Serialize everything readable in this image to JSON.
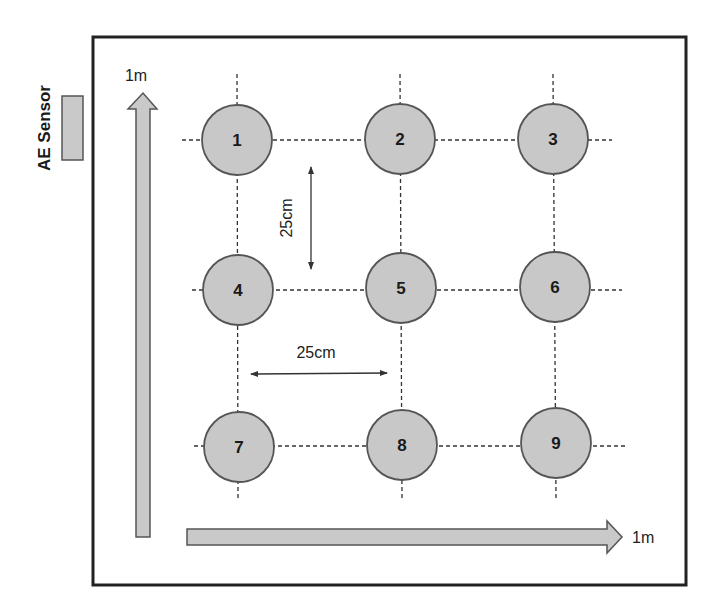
{
  "diagram": {
    "sensor": {
      "label": "AE Sensor"
    },
    "axes": {
      "vertical": {
        "label": "1m"
      },
      "horizontal": {
        "label": "1m"
      }
    },
    "spacing": {
      "vertical_label": "25cm",
      "horizontal_label": "25cm"
    },
    "nodes": [
      {
        "id": "1",
        "label": "1"
      },
      {
        "id": "2",
        "label": "2"
      },
      {
        "id": "3",
        "label": "3"
      },
      {
        "id": "4",
        "label": "4"
      },
      {
        "id": "5",
        "label": "5"
      },
      {
        "id": "6",
        "label": "6"
      },
      {
        "id": "7",
        "label": "7"
      },
      {
        "id": "8",
        "label": "8"
      },
      {
        "id": "9",
        "label": "9"
      }
    ],
    "colors": {
      "node_fill": "#c8c8c8",
      "node_stroke": "#555555",
      "frame": "#222222",
      "arrow_fill": "#c9c9c9"
    }
  }
}
